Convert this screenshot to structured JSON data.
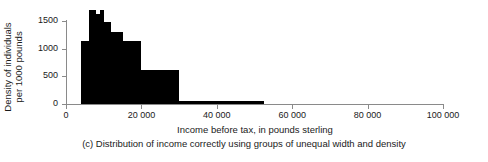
{
  "chart_data": {
    "type": "bar",
    "title": "",
    "subtitle": "",
    "caption": "(c) Distribution of income correctly using groups of unequal width and density",
    "xlabel": "Income before tax, in pounds sterling",
    "ylabel_lines": [
      "Density of individuals",
      "per 1000 pounds"
    ],
    "ylabel": "Density of individuals per 1000 pounds",
    "xlim": [
      0,
      100000
    ],
    "ylim": [
      0,
      1700
    ],
    "grid": false,
    "legend": null,
    "xticks": [
      0,
      20000,
      40000,
      60000,
      80000,
      100000
    ],
    "xticklabels": [
      "0",
      "20 000",
      "40 000",
      "60 000",
      "80 000",
      "100 000"
    ],
    "yticks": [
      0,
      500,
      1000,
      1500
    ],
    "yticklabels": [
      "0",
      "500",
      "1000",
      "1500"
    ],
    "bins": [
      {
        "x0": 4000,
        "x1": 6000,
        "density": 1140
      },
      {
        "x0": 6000,
        "x1": 8000,
        "density": 1700
      },
      {
        "x0": 8000,
        "x1": 9000,
        "density": 1620
      },
      {
        "x0": 9000,
        "x1": 10000,
        "density": 1700
      },
      {
        "x0": 10000,
        "x1": 12000,
        "density": 1490
      },
      {
        "x0": 12000,
        "x1": 15000,
        "density": 1300
      },
      {
        "x0": 15000,
        "x1": 20000,
        "density": 1140
      },
      {
        "x0": 20000,
        "x1": 30000,
        "density": 620
      },
      {
        "x0": 30000,
        "x1": 52500,
        "density": 60
      }
    ],
    "bar_color": "#000000",
    "axis_color": "#8a8a8a"
  }
}
